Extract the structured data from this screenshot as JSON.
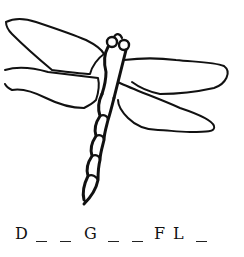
{
  "illustration": {
    "subject": "dragonfly",
    "style": "black line drawing on white",
    "stroke_color": "#111111",
    "background_color": "#ffffff"
  },
  "puzzle": {
    "answer_pattern": "D _ _ G _ _ F L _",
    "slots": [
      {
        "type": "letter",
        "value": "D",
        "x": 15
      },
      {
        "type": "blank",
        "value": "",
        "x": 39
      },
      {
        "type": "blank",
        "value": "",
        "x": 63
      },
      {
        "type": "letter",
        "value": "G",
        "x": 84
      },
      {
        "type": "blank",
        "value": "",
        "x": 108
      },
      {
        "type": "blank",
        "value": "",
        "x": 133
      },
      {
        "type": "letter",
        "value": "F",
        "x": 154
      },
      {
        "type": "letter",
        "value": "L",
        "x": 173
      },
      {
        "type": "blank",
        "value": "",
        "x": 197
      }
    ]
  }
}
